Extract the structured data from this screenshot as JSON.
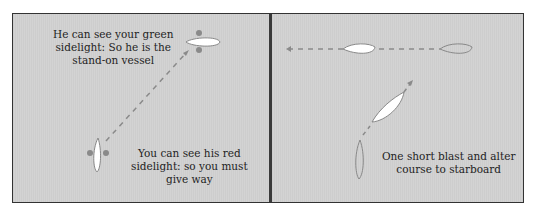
{
  "left_panel": {
    "caption_top": [
      "He can see your green",
      "sidelight: So he is the",
      "stand-on vessel"
    ],
    "caption_bottom": [
      "You can see his red",
      "sidelight: so you must",
      "give way"
    ]
  },
  "right_panel": {
    "caption": [
      "One short blast and alter",
      "course to starboard"
    ]
  },
  "colors": {
    "background": "#d0d0d0",
    "border": "#333333",
    "boat_fill": "#ffffff",
    "boat_outline": "#888888",
    "sidelight": "#8a8a8a",
    "dashed_track": "#8a8a8a"
  }
}
